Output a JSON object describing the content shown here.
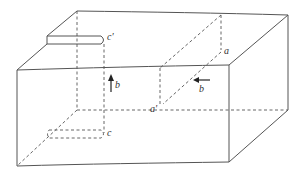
{
  "figure": {
    "labels": {
      "c_prime": "c'",
      "c": "c",
      "a": "a",
      "a_prime": "a'",
      "b_vertical": "b",
      "b_horizontal": "b"
    },
    "colors": {
      "line": "#555555",
      "background": "#ffffff"
    }
  }
}
